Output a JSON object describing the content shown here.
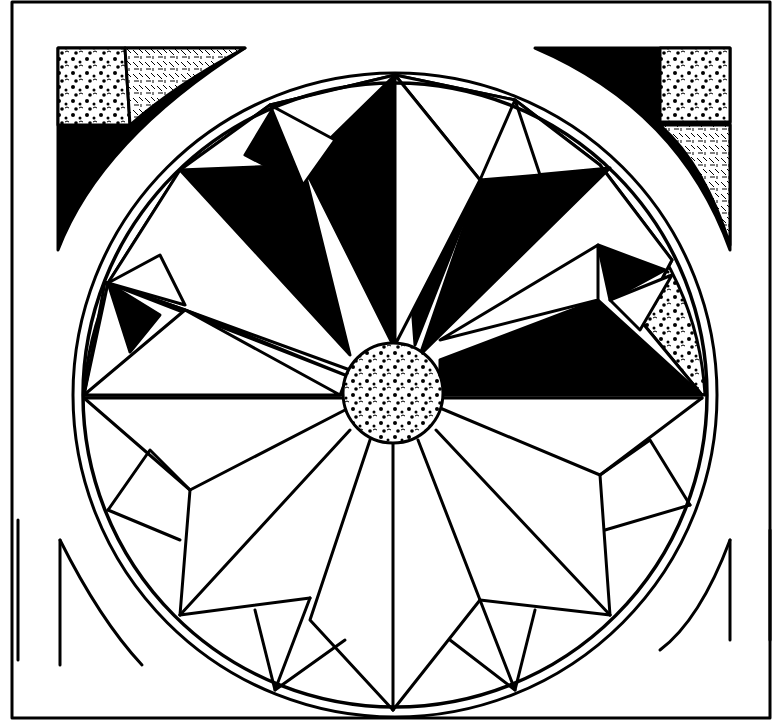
{
  "artwork": {
    "subject": "rose-window-geometric-line-art",
    "palette": {
      "ink": "#000000",
      "paper": "#ffffff"
    },
    "frame": {
      "x": 12,
      "y": 2,
      "w": 758,
      "h": 716
    },
    "circle": {
      "cx": 395,
      "cy": 395,
      "r": 322
    },
    "hub": {
      "cx": 393,
      "cy": 393,
      "r": 50
    },
    "fills": {
      "black": [
        "M303,165 L395,75 L393,345 Z",
        "M180,170 L303,165 L350,355 Z",
        "M105,280 L185,310 L350,370 Z",
        "M245,155 L275,105 L303,185 Z",
        "M480,180 L515,100 L595,170 Z",
        "M415,345 L480,180 L610,168 Z",
        "M440,360 L598,300 L702,395 L440,395 Z",
        "M598,245 L665,270 L610,300 Z",
        "M108,283 L160,315 L130,352 Z"
      ],
      "speckle": [
        "M270,105 L395,75 L303,95 Z",
        "M395,75 L515,100 L480,180 Z",
        "M515,100 L600,155 L598,245 Z",
        "M600,165 L672,260 L598,245 Z",
        "M640,320 L672,260 L702,395 Z",
        "M180,170 L245,155 L275,105 L210,130 Z",
        "M108,283 L180,170 L150,225 Z",
        "M84,395 L108,283 L130,352 Z"
      ],
      "white": [
        "M303,165 L350,355 L395,345 L395,75 Z"
      ]
    },
    "corners": {
      "top_left": {
        "black": "M58,48 L58,250 Q100,140 245,48 Z",
        "speckle": "M58,48 L125,48 L130,125 L58,125 Z",
        "hatch": "M125,48 L245,48 Q175,85 130,125 Z"
      },
      "top_right": {
        "black": "M535,48 L730,48 L730,250 Q680,110 535,48 Z",
        "speckle": "M660,48 L730,48 L730,122 L660,122 Z",
        "hatch": "M660,125 L730,125 L730,245 Q705,165 660,125 Z"
      }
    },
    "bottom_lines": [
      "M18,520 L18,660",
      "M60,540 L60,665 M60,540 Q100,620 142,665",
      "M730,540 L730,640 M730,540 Q700,620 660,650",
      "M770,530 L770,640"
    ],
    "lower_spokes": [
      "M393,443 L393,710",
      "M365,440 L310,620 M310,620 L393,710",
      "M345,430 L180,615",
      "M345,410 L190,490",
      "M84,398 L345,398",
      "M425,440 L480,600 M480,600 L393,710",
      "M440,425 L610,615",
      "M440,405 L600,475",
      "M440,398 L702,398"
    ],
    "lower_facets": [
      "M84,398 L190,490 L180,615",
      "M108,510 L150,450 L190,490",
      "M108,510 L180,540",
      "M180,615 L310,598",
      "M255,610 L275,690 L310,598",
      "M275,690 L345,640",
      "M702,398 L600,475 L610,615",
      "M680,510 L650,440 L600,475",
      "M680,510 L605,530",
      "M610,615 L480,600",
      "M535,610 L515,690 L480,600",
      "M515,690 L450,640"
    ]
  }
}
